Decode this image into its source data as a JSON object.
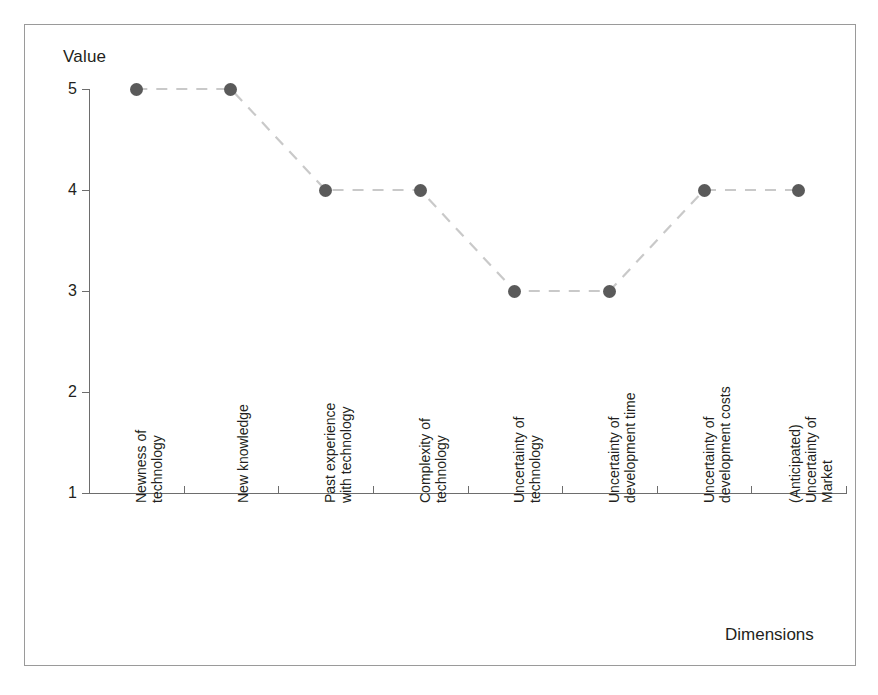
{
  "chart_data": {
    "type": "line",
    "title": "",
    "xlabel": "Dimensions",
    "ylabel": "Value",
    "ylim": [
      1,
      5
    ],
    "yticks": [
      1,
      2,
      3,
      4,
      5
    ],
    "grid": false,
    "legend": "none",
    "marker": "filled-circle",
    "linestyle": "dashed",
    "categories": [
      "Newness of\ntechnology",
      "New knowledge",
      "Past experience\nwith technology",
      "Complexity of\ntechnology",
      "Uncertainty of\ntechnology",
      "Uncertainty of\ndevelopment time",
      "Uncertainty of\ndevelopment costs",
      "(Anticipated)\nUncertainty of\nMarket"
    ],
    "values": [
      5,
      5,
      4,
      4,
      3,
      3,
      4,
      4
    ],
    "series": [
      {
        "name": "",
        "values": [
          5,
          5,
          4,
          4,
          3,
          3,
          4,
          4
        ]
      }
    ]
  },
  "axes": {
    "y_title": "Value",
    "x_title": "Dimensions",
    "y_tick_labels": [
      "5",
      "4",
      "3",
      "2",
      "1"
    ]
  },
  "colors": {
    "marker": "#5a5a5a",
    "line": "#c9c9c9",
    "axis": "#6d6d6d",
    "frame": "#9a9a9a",
    "text": "#231f20",
    "background": "#ffffff"
  }
}
